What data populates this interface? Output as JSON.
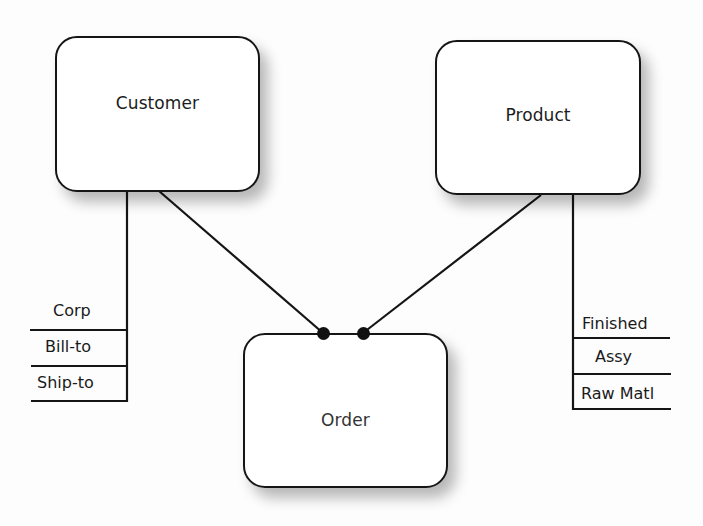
{
  "diagram": {
    "type": "entity-relationship",
    "entities": [
      {
        "id": "customer",
        "label": "Customer"
      },
      {
        "id": "product",
        "label": "Product"
      },
      {
        "id": "order",
        "label": "Order"
      }
    ],
    "relationships": [
      {
        "from": "customer",
        "to": "order",
        "end_marker": "filled-dot"
      },
      {
        "from": "product",
        "to": "order",
        "end_marker": "filled-dot"
      }
    ],
    "hierarchies": {
      "customer": {
        "parent": "Customer",
        "levels": [
          "Corp",
          "Bill-to",
          "Ship-to"
        ]
      },
      "product": {
        "parent": "Product",
        "levels": [
          "Finished",
          "Assy",
          "Raw Matl"
        ]
      }
    },
    "colors": {
      "line": "#151515",
      "box_fill": "#ffffff",
      "background": "#fdfdfd"
    }
  }
}
